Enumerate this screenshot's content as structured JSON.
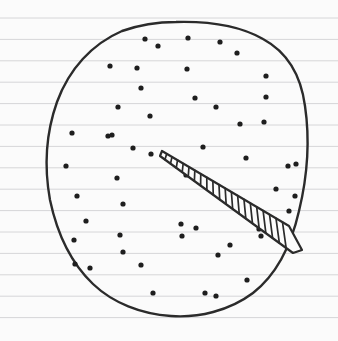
{
  "canvas": {
    "width": 338,
    "height": 341,
    "title": "Hand-drawn dotted blob with tapered ladder wedge",
    "medium": "ink on ruled notebook paper"
  },
  "paper": {
    "background_color": "#fbfbfb",
    "rule_color": "#d6d6d8",
    "rule_width": 1,
    "rule_spacing": 21.4,
    "rule_first_y": 18,
    "rule_count": 15,
    "margin_color": "#e8e8ea"
  },
  "ink": {
    "outline_color": "#2b2b2b",
    "outline_width": 2.4,
    "dot_color": "#1e1e1e",
    "wedge_color": "#2b2b2b",
    "wedge_fill": "#fcfcfc"
  },
  "blob": {
    "label": "irregular hand-drawn circle outline",
    "center_x": 176,
    "center_y": 168,
    "bounds": {
      "left": 48,
      "top": 22,
      "right": 306,
      "bottom": 316
    },
    "path": "M 176 22 C 212 21 242 27 263 39 C 287 52 301 76 305 106 C 310 140 307 178 299 211 C 291 246 276 275 253 293 C 229 311 198 318 171 316 C 141 314 113 303 93 284 C 71 263 57 233 50 200 C 44 167 46 133 57 102 C 69 69 92 44 122 31 C 139 25 157 22 176 22 Z"
  },
  "wedge": {
    "label": "tapered ladder-like wedge from interior toward lower-right rim",
    "tip_x": 162,
    "tip_y": 151,
    "base_center_x": 299,
    "base_center_y": 246,
    "rung_count": 20,
    "outline_path": "M 162 151 L 289 226 L 302 250 L 293 253 L 160 156 Z",
    "description": "narrow pointed end at upper-left widening to a blunt end at the blob edge, crossed by ladder rungs"
  },
  "dots": {
    "label": "scattered ink dots filling the blob",
    "count": 52,
    "radius": 2.6,
    "points": [
      [
        145,
        39
      ],
      [
        188,
        38
      ],
      [
        220,
        42
      ],
      [
        158,
        46
      ],
      [
        110,
        66
      ],
      [
        137,
        68
      ],
      [
        187,
        69
      ],
      [
        237,
        53
      ],
      [
        266,
        76
      ],
      [
        141,
        88
      ],
      [
        195,
        98
      ],
      [
        266,
        97
      ],
      [
        118,
        107
      ],
      [
        216,
        107
      ],
      [
        112,
        135
      ],
      [
        150,
        116
      ],
      [
        240,
        124
      ],
      [
        264,
        122
      ],
      [
        72,
        133
      ],
      [
        108,
        136
      ],
      [
        133,
        148
      ],
      [
        151,
        154
      ],
      [
        203,
        147
      ],
      [
        246,
        158
      ],
      [
        66,
        166
      ],
      [
        117,
        178
      ],
      [
        186,
        175
      ],
      [
        288,
        166
      ],
      [
        296,
        164
      ],
      [
        77,
        196
      ],
      [
        123,
        204
      ],
      [
        276,
        189
      ],
      [
        295,
        196
      ],
      [
        86,
        221
      ],
      [
        181,
        224
      ],
      [
        289,
        211
      ],
      [
        74,
        240
      ],
      [
        120,
        235
      ],
      [
        196,
        228
      ],
      [
        259,
        229
      ],
      [
        75,
        264
      ],
      [
        123,
        252
      ],
      [
        182,
        236
      ],
      [
        90,
        268
      ],
      [
        141,
        265
      ],
      [
        230,
        245
      ],
      [
        218,
        255
      ],
      [
        261,
        236
      ],
      [
        153,
        293
      ],
      [
        205,
        293
      ],
      [
        216,
        296
      ],
      [
        247,
        280
      ]
    ]
  }
}
